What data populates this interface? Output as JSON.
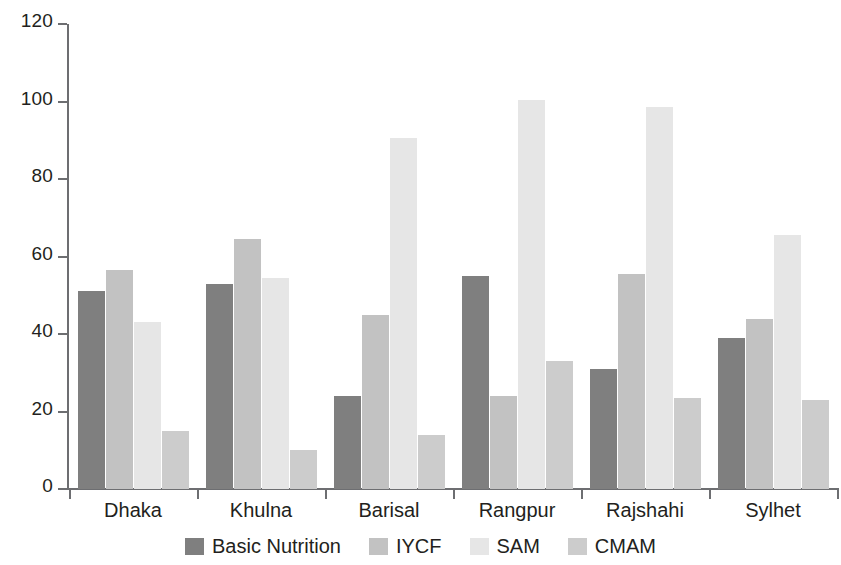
{
  "chart_data": {
    "type": "bar",
    "title": "",
    "subtitle": "",
    "xlabel": "",
    "ylabel": "",
    "ylim": [
      0,
      120
    ],
    "yticks": [
      0,
      20,
      40,
      60,
      80,
      100,
      120
    ],
    "ytick_labels": [
      "0",
      "20",
      "40",
      "60",
      "80",
      "100",
      "120"
    ],
    "grid": false,
    "legend_position": "bottom",
    "categories": [
      "Dhaka",
      "Khulna",
      "Barisal",
      "Rangpur",
      "Rajshahi",
      "Sylhet"
    ],
    "series": [
      {
        "name": "Basic Nutrition",
        "color": "#7f7f7f",
        "values": [
          51,
          53,
          24,
          55,
          31,
          39
        ]
      },
      {
        "name": "IYCF",
        "color": "#c2c2c2",
        "values": [
          56.5,
          64.5,
          45,
          24,
          55.5,
          44
        ]
      },
      {
        "name": "SAM",
        "color": "#e6e6e6",
        "values": [
          43,
          54.5,
          90.5,
          100.5,
          98.5,
          65.5
        ]
      },
      {
        "name": "CMAM",
        "color": "#cccccc",
        "values": [
          15,
          10,
          14,
          33,
          23.5,
          23
        ]
      }
    ]
  },
  "axis": {
    "axis_color": "#6d6e71",
    "text_color": "#231f20"
  }
}
